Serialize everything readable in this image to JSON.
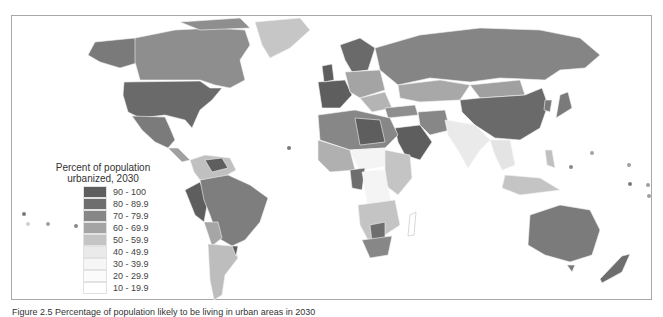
{
  "legend": {
    "title_line1": "Percent of population",
    "title_line2": "urbanized, 2030",
    "items": [
      {
        "label": "90 - 100",
        "color": "#5e5e5e"
      },
      {
        "label": "80 - 89.9",
        "color": "#6e6e6e"
      },
      {
        "label": "70 - 79.9",
        "color": "#878787"
      },
      {
        "label": "60 - 69.9",
        "color": "#a4a4a4"
      },
      {
        "label": "50 - 59.9",
        "color": "#c4c4c4"
      },
      {
        "label": "40 - 49.9",
        "color": "#eaeaea"
      },
      {
        "label": "30 - 39.9",
        "color": "#f6f6f6"
      },
      {
        "label": "20 - 29.9",
        "color": "#fbfbfb"
      },
      {
        "label": "10 - 19.9",
        "color": "#ffffff"
      }
    ]
  },
  "caption": "Figure 2.5  Percentage of population likely to be living in urban areas in 2030",
  "map": {
    "title": "World map: percent of population urbanized, 2030",
    "regions": [
      {
        "name": "Canada",
        "class": "80 - 89.9"
      },
      {
        "name": "United States",
        "class": "80 - 89.9"
      },
      {
        "name": "Mexico",
        "class": "80 - 89.9"
      },
      {
        "name": "Greenland",
        "class": "50 - 59.9"
      },
      {
        "name": "Brazil",
        "class": "80 - 89.9"
      },
      {
        "name": "Argentina",
        "class": "90 - 100"
      },
      {
        "name": "Russia",
        "class": "70 - 79.9"
      },
      {
        "name": "China",
        "class": "60 - 69.9"
      },
      {
        "name": "India",
        "class": "40 - 49.9"
      },
      {
        "name": "Australia",
        "class": "90 - 100"
      },
      {
        "name": "Saudi Arabia",
        "class": "80 - 89.9"
      },
      {
        "name": "Europe",
        "class": "70 - 79.9"
      }
    ]
  }
}
